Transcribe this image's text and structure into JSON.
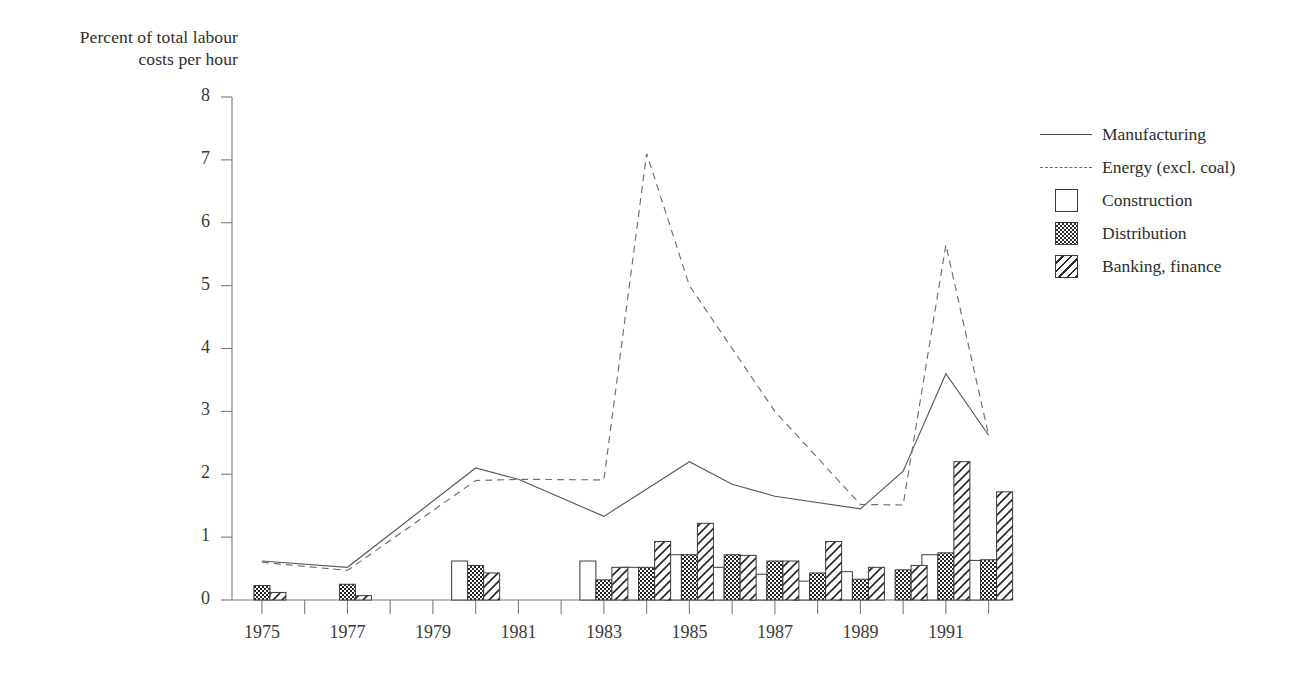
{
  "axis_title": {
    "line1": "Percent of total labour",
    "line2": "costs per hour"
  },
  "legend": {
    "items": [
      {
        "label": "Manufacturing",
        "key": "line-solid-icon"
      },
      {
        "label": "Energy (excl. coal)",
        "key": "line-dashed-icon"
      },
      {
        "label": "Construction",
        "key": "swatch-empty-icon"
      },
      {
        "label": "Distribution",
        "key": "swatch-checker-icon"
      },
      {
        "label": "Banking, finance",
        "key": "swatch-diagonal-icon"
      }
    ]
  },
  "chart_data": {
    "type": "line",
    "title": "Percent of total labour costs per hour",
    "xlabel": "",
    "ylabel": "Percent of total labour costs per hour",
    "xlim": [
      1974.3,
      1992.5
    ],
    "ylim": [
      0,
      8
    ],
    "grid": false,
    "legend_position": "right",
    "ytick_labels": [
      "0",
      "1",
      "2",
      "3",
      "4",
      "5",
      "6",
      "7",
      "8"
    ],
    "ytick_values": [
      0,
      1,
      2,
      3,
      4,
      5,
      6,
      7,
      8
    ],
    "xtick_labels": [
      "1975",
      "1977",
      "1979",
      "1981",
      "1983",
      "1985",
      "1987",
      "1989",
      "1991"
    ],
    "xtick_values": [
      1975,
      1977,
      1979,
      1981,
      1983,
      1985,
      1987,
      1989,
      1991
    ],
    "xtick_minor_values": [
      1976,
      1978,
      1980,
      1982,
      1984,
      1986,
      1988,
      1990,
      1992
    ],
    "x": [
      1975,
      1976,
      1977,
      1978,
      1979,
      1980,
      1981,
      1982,
      1983,
      1984,
      1985,
      1986,
      1987,
      1988,
      1989,
      1990,
      1991,
      1992
    ],
    "series": [
      {
        "name": "Manufacturing",
        "style": "solid-line",
        "x": [
          1975,
          1977,
          1980,
          1981,
          1983,
          1985,
          1986,
          1987,
          1989,
          1990,
          1991,
          1992
        ],
        "values": [
          0.62,
          0.52,
          2.1,
          1.92,
          1.33,
          2.2,
          1.84,
          1.65,
          1.45,
          2.05,
          3.6,
          2.62
        ]
      },
      {
        "name": "Energy (excl. coal)",
        "style": "dashed-line",
        "x": [
          1975,
          1977,
          1980,
          1981,
          1983,
          1984,
          1985,
          1987,
          1989,
          1990,
          1991,
          1992
        ],
        "values": [
          0.6,
          0.47,
          1.9,
          1.92,
          1.91,
          7.1,
          5.0,
          3.0,
          1.52,
          1.51,
          5.65,
          2.62
        ]
      },
      {
        "name": "Construction",
        "style": "bar-empty",
        "x": [
          1975,
          1977,
          1980,
          1983,
          1984,
          1985,
          1986,
          1987,
          1988,
          1989,
          1990,
          1991,
          1992
        ],
        "values": [
          0.0,
          0.0,
          0.62,
          0.62,
          0.52,
          0.72,
          0.52,
          0.41,
          0.3,
          0.45,
          0.0,
          0.72,
          0.63
        ]
      },
      {
        "name": "Distribution",
        "style": "bar-checker",
        "x": [
          1975,
          1977,
          1980,
          1983,
          1984,
          1985,
          1986,
          1987,
          1988,
          1989,
          1990,
          1991,
          1992
        ],
        "values": [
          0.23,
          0.25,
          0.55,
          0.32,
          0.52,
          0.72,
          0.72,
          0.62,
          0.43,
          0.33,
          0.48,
          0.75,
          0.64
        ]
      },
      {
        "name": "Banking, finance",
        "style": "bar-diagonal",
        "x": [
          1975,
          1977,
          1980,
          1983,
          1984,
          1985,
          1986,
          1987,
          1988,
          1989,
          1990,
          1991,
          1992
        ],
        "values": [
          0.12,
          0.07,
          0.43,
          0.52,
          0.93,
          1.22,
          0.71,
          0.62,
          0.93,
          0.52,
          0.55,
          2.2,
          1.72
        ]
      }
    ]
  }
}
